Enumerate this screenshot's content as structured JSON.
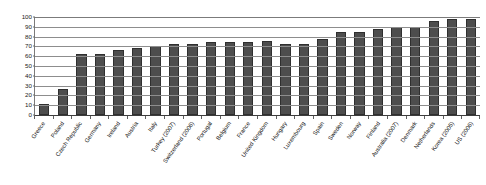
{
  "chart_data": {
    "type": "bar",
    "title": "",
    "subtitle": "",
    "xlabel": "",
    "ylabel": "",
    "ylim": [
      0,
      100
    ],
    "yticks": [
      0,
      10,
      20,
      30,
      40,
      50,
      60,
      70,
      80,
      90,
      100
    ],
    "grid": true,
    "legend": null,
    "legend_position": "none",
    "orientation": "vertical",
    "bar_color": "#4d4d4d",
    "bar_edge_color": "#2f2f2f",
    "gridline_color": "#8d8d8d",
    "axis_color": "#3d3d3d",
    "background_color": "#ffffff",
    "categories": [
      "Greece",
      "Poland",
      "Czech Republic",
      "Germany",
      "Ireland",
      "Austria",
      "Italy",
      "Turkey (2007)",
      "Switzerland (2006)",
      "Portugal",
      "Belgium",
      "France",
      "United Kingdom",
      "Hungary",
      "Luxembourg",
      "Spain",
      "Sweden",
      "Norway",
      "Finland",
      "Australia (2007)",
      "Denmark",
      "Netherlands",
      "Korea (2005)",
      "US (2006)"
    ],
    "values": [
      11,
      27,
      62,
      62,
      66,
      68,
      70,
      72,
      72,
      74,
      74,
      75,
      76,
      72,
      72,
      78,
      85,
      85,
      88,
      90,
      90,
      96,
      98,
      98
    ]
  }
}
